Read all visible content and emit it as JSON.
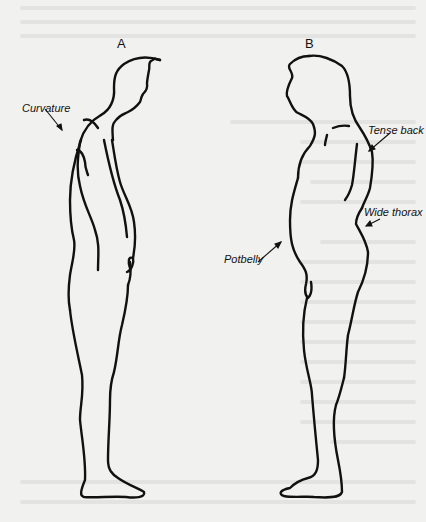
{
  "figures": [
    {
      "id": "A",
      "label": "A"
    },
    {
      "id": "B",
      "label": "B"
    }
  ],
  "annotations": {
    "curvature": "Curvature",
    "tense_back": "Tense back",
    "wide_thorax": "Wide thorax",
    "potbelly": "Potbelly"
  },
  "colors": {
    "ink": "#111111",
    "paper": "#f1f1ef"
  }
}
